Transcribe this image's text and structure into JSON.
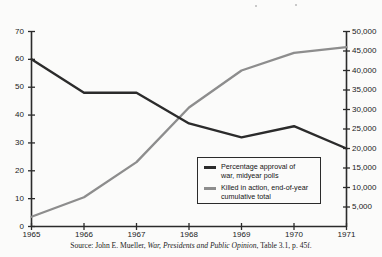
{
  "chart_data": {
    "type": "line",
    "title": "",
    "xlabel": "",
    "ylabel": "",
    "categories": [
      1965,
      1966,
      1967,
      1968,
      1969,
      1970,
      1971
    ],
    "x_tick_labels": [
      "1965",
      "1966",
      "1967",
      "1968",
      "1969",
      "1970",
      "1971"
    ],
    "grid": false,
    "legend_position": "inside-lower-right",
    "axes": {
      "left": {
        "label": "",
        "min": 0,
        "max": 70,
        "step": 10,
        "tick_labels": [
          "0",
          "10",
          "20",
          "30",
          "40",
          "50",
          "60",
          "70"
        ],
        "values": [
          0,
          10,
          20,
          30,
          40,
          50,
          60,
          70
        ]
      },
      "right": {
        "label": "",
        "min": 0,
        "max": 50000,
        "step": 5000,
        "tick_labels": [
          "5,000",
          "10,000",
          "15,000",
          "20,000",
          "25,000",
          "30,000",
          "35,000",
          "40,000",
          "45,000",
          "50,000"
        ],
        "values": [
          5000,
          10000,
          15000,
          20000,
          25000,
          30000,
          35000,
          40000,
          45000,
          50000
        ]
      }
    },
    "series": [
      {
        "name": "Percentage approval of war, midyear polls",
        "legend_label_line1": "Percentage approval of",
        "legend_label_line2": "war, midyear polls",
        "axis": "left",
        "color": "#2b2b2b",
        "values": [
          60,
          48,
          48,
          37,
          32,
          36,
          28
        ]
      },
      {
        "name": "Killed in action, end-of-year cumulative total",
        "legend_label_line1": "Killed in action, end-of-year",
        "legend_label_line2": "cumulative total",
        "axis": "right",
        "color": "#8d8d8d",
        "values": [
          2500,
          7500,
          16500,
          30500,
          40000,
          44500,
          46000
        ]
      }
    ]
  },
  "source": {
    "prefix": "Source: John E. Mueller, ",
    "italic_title": "War, Presidents and Public Opinion",
    "suffix": ", Table 3.1, p. 45f."
  },
  "colors": {
    "approval_line": "#2b2b2b",
    "killed_line": "#8d8d8d",
    "axis": "#2b2b2b",
    "background": "#fbfbfa",
    "text": "#1a1a1a"
  }
}
